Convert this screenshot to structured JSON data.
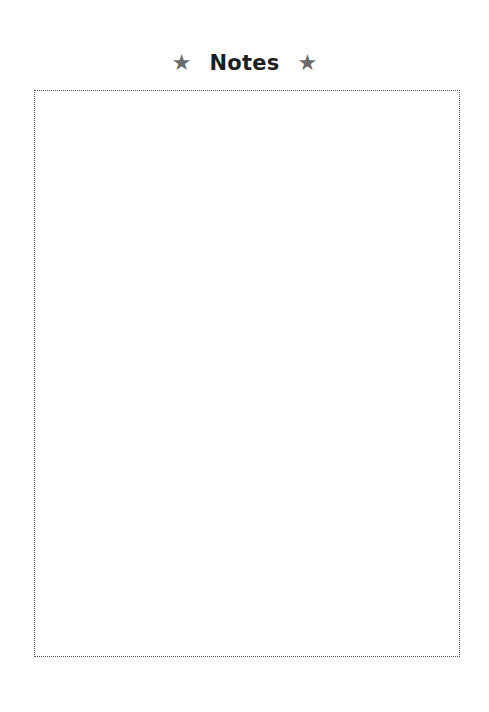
{
  "header": {
    "title": "Notes",
    "left_icon": "star-icon",
    "left_icon_glyph": "★",
    "right_icon": "star-icon",
    "right_icon_glyph": "★"
  },
  "notes_area": {
    "content": ""
  },
  "colors": {
    "title": "#1e1e1e",
    "star": "#6b6b6b",
    "border": "#555555",
    "background": "#ffffff"
  }
}
